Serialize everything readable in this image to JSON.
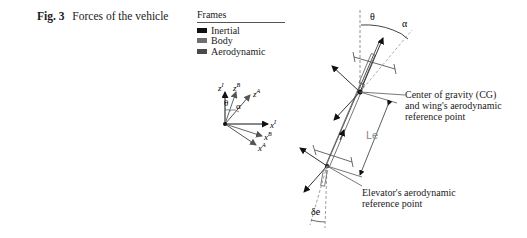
{
  "caption": {
    "number": "Fig. 3",
    "text": "Forces of the vehicle"
  },
  "legend": {
    "title": "Frames",
    "items": [
      {
        "label": "Inertial",
        "color": "#111111"
      },
      {
        "label": "Body",
        "color": "#6e6e6e"
      },
      {
        "label": "Aerodynamic",
        "color": "#4a4a4a"
      }
    ]
  },
  "frames_diagram": {
    "axes": {
      "zI": "z",
      "zI_sup": "I",
      "zB": "z",
      "zB_sup": "B",
      "zA": "z",
      "zA_sup": "A",
      "xI": "x",
      "xI_sup": "I",
      "xB": "x",
      "xB_sup": "B",
      "xA": "x",
      "xA_sup": "A"
    },
    "angles": {
      "theta": "θ",
      "alpha": "α"
    }
  },
  "vehicle_diagram": {
    "angles": {
      "theta": "θ",
      "alpha": "α",
      "delta_e": "δe"
    },
    "length_label": "Le",
    "cg_label": [
      "Center of gravity (CG)",
      "and wing's aerodynamic",
      "reference point"
    ],
    "elevator_label": [
      "Elevator's aerodynamic",
      "reference point"
    ]
  }
}
